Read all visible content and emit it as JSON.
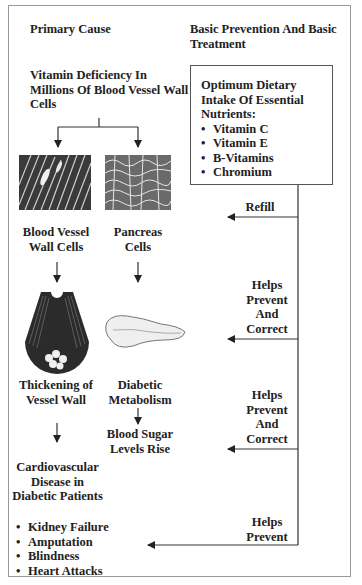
{
  "headers": {
    "left": "Primary Cause",
    "right": "Basic Prevention And Basic Treatment"
  },
  "left_column": {
    "root": "Vitamin Deficiency In Millions Of Blood Vessel Wall Cells",
    "branch_a": {
      "image_icon": "blood-vessel-cells-micrograph",
      "label": "Blood Vessel Wall Cells",
      "stage2_icon": "thickened-artery-illustration",
      "stage2_label": "Thickening of Vessel Wall",
      "outcome": "Cardiovascular Disease in Diabetic Patients"
    },
    "branch_b": {
      "image_icon": "pancreas-cells-micrograph",
      "label": "Pancreas Cells",
      "stage2_icon": "pancreas-illustration",
      "stage2_label": "Diabetic Metabolism",
      "outcome": "Blood Sugar Levels Rise"
    },
    "complications": [
      "Kidney Failure",
      "Amputation",
      "Blindness",
      "Heart Attacks"
    ]
  },
  "treatment_box": {
    "title": "Optimum Dietary Intake Of Essential Nutrients:",
    "items": [
      "Vitamin C",
      "Vitamin E",
      "B-Vitamins",
      "Chromium"
    ]
  },
  "arrows": [
    {
      "label": "Refill"
    },
    {
      "label": "Helps Prevent And Correct"
    },
    {
      "label": "Helps Prevent And Correct"
    },
    {
      "label": "Helps Prevent"
    }
  ],
  "colors": {
    "line": "#333333",
    "border": "#9a9a9a",
    "text": "#222222"
  }
}
